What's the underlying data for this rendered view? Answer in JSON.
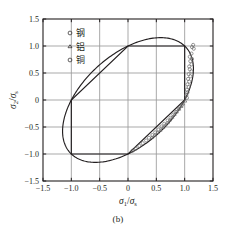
{
  "figure": {
    "caption": "(b)",
    "panel_label": "(b)"
  },
  "chart_data": {
    "type": "scatter",
    "title": "",
    "subtitle": "",
    "xlabel": "σ₁/σₛ",
    "ylabel": "σ₂/σₛ",
    "xlabel_parts": {
      "num": "σ",
      "num_sub": "1",
      "den": "σ",
      "den_sub": "s"
    },
    "ylabel_parts": {
      "num": "σ",
      "num_sub": "2",
      "den": "σ",
      "den_sub": "s"
    },
    "xlim": [
      -1.5,
      1.5
    ],
    "ylim": [
      -1.5,
      1.5
    ],
    "xticks": [
      "-1.5",
      "-1.0",
      "-0.5",
      "0",
      "0.5",
      "1.0",
      "1.5"
    ],
    "yticks": [
      "1.5",
      "1.0",
      "0.5",
      "0",
      "-0.5",
      "-1.0",
      "-1.5"
    ],
    "xtick_values": [
      -1.5,
      -1.0,
      -0.5,
      0,
      0.5,
      1.0,
      1.5
    ],
    "ytick_values": [
      1.5,
      1.0,
      0.5,
      0,
      -0.5,
      -1.0,
      -1.5
    ],
    "grid": true,
    "grid_color": "#9a9a9a",
    "axis_color": "#231f20",
    "curve_color": "#231f20",
    "marker_color": "#6d6d6d",
    "legend_position": "top-left",
    "legend": [
      {
        "label": "钢",
        "marker": "circle"
      },
      {
        "label": "铝",
        "marker": "triangle"
      },
      {
        "label": "铜",
        "marker": "circle"
      }
    ],
    "curves": [
      {
        "name": "von Mises ellipse",
        "equation": "x^2 - x*y + y^2 = 1",
        "style": "solid"
      },
      {
        "name": "Tresca hexagon",
        "vertices": [
          [
            1,
            0
          ],
          [
            1,
            1
          ],
          [
            0,
            1
          ],
          [
            -1,
            0
          ],
          [
            -1,
            -1
          ],
          [
            0,
            -1
          ]
        ],
        "style": "solid"
      }
    ],
    "series": [
      {
        "name": "钢",
        "marker": "circle",
        "points": [
          [
            1.15,
            1.02
          ],
          [
            1.13,
            0.98
          ],
          [
            1.16,
            0.95
          ],
          [
            1.12,
            0.86
          ],
          [
            1.09,
            0.8
          ],
          [
            1.13,
            0.76
          ],
          [
            1.1,
            0.72
          ],
          [
            1.12,
            0.66
          ],
          [
            1.08,
            0.62
          ],
          [
            1.09,
            0.57
          ],
          [
            1.12,
            0.53
          ],
          [
            1.07,
            0.48
          ],
          [
            1.1,
            0.44
          ],
          [
            1.06,
            0.39
          ],
          [
            1.08,
            0.34
          ],
          [
            1.05,
            0.29
          ],
          [
            1.07,
            0.24
          ],
          [
            1.04,
            0.19
          ],
          [
            1.05,
            0.14
          ],
          [
            1.03,
            0.09
          ],
          [
            1.04,
            0.04
          ]
        ]
      },
      {
        "name": "铝",
        "marker": "triangle",
        "points": [
          [
            1.01,
            -0.02
          ],
          [
            0.97,
            -0.07
          ],
          [
            0.94,
            -0.12
          ],
          [
            0.9,
            -0.17
          ],
          [
            0.86,
            -0.22
          ],
          [
            0.82,
            -0.27
          ],
          [
            0.78,
            -0.32
          ],
          [
            0.74,
            -0.37
          ],
          [
            0.7,
            -0.42
          ],
          [
            0.66,
            -0.46
          ],
          [
            0.62,
            -0.51
          ],
          [
            0.57,
            -0.56
          ],
          [
            0.52,
            -0.6
          ],
          [
            0.47,
            -0.65
          ],
          [
            0.42,
            -0.69
          ]
        ]
      },
      {
        "name": "铜",
        "marker": "circle",
        "points": [
          [
            0.95,
            -0.1
          ],
          [
            0.9,
            -0.16
          ],
          [
            0.85,
            -0.22
          ],
          [
            0.8,
            -0.27
          ],
          [
            0.75,
            -0.33
          ],
          [
            0.7,
            -0.38
          ],
          [
            0.64,
            -0.44
          ],
          [
            0.59,
            -0.49
          ],
          [
            0.54,
            -0.55
          ],
          [
            0.48,
            -0.6
          ],
          [
            0.43,
            -0.65
          ],
          [
            0.37,
            -0.7
          ],
          [
            0.32,
            -0.75
          ],
          [
            0.26,
            -0.8
          ],
          [
            0.2,
            -0.85
          ],
          [
            0.14,
            -0.9
          ],
          [
            0.08,
            -0.94
          ]
        ]
      }
    ]
  }
}
